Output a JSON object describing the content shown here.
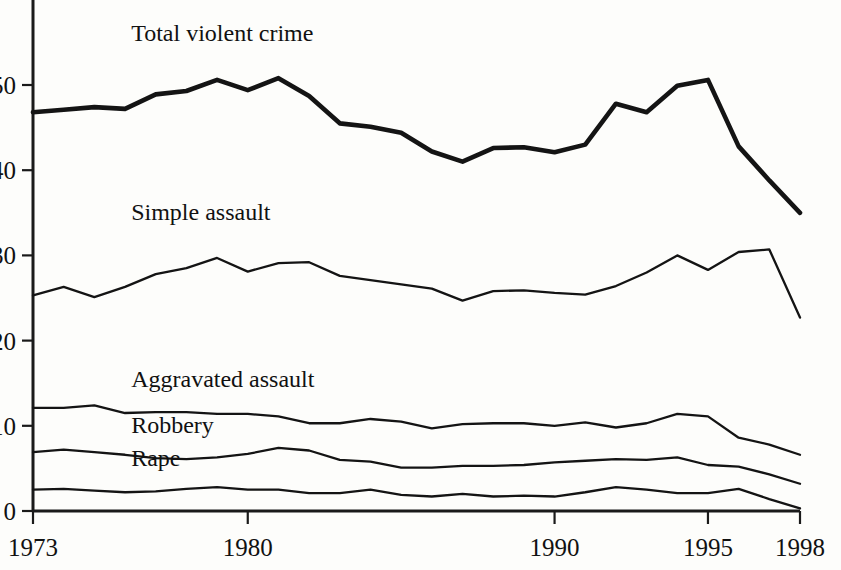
{
  "chart_data": {
    "type": "line",
    "title": "",
    "subtitle": "",
    "xlabel": "",
    "ylabel": "",
    "xlim": [
      1973,
      1998
    ],
    "ylim": [
      0,
      57
    ],
    "grid": false,
    "legend_position": "inline-labels",
    "x": [
      1973,
      1974,
      1975,
      1976,
      1977,
      1978,
      1979,
      1980,
      1981,
      1982,
      1983,
      1984,
      1985,
      1986,
      1987,
      1988,
      1989,
      1990,
      1991,
      1992,
      1993,
      1994,
      1995,
      1996,
      1997,
      1998
    ],
    "xticks": [
      1973,
      1980,
      1990,
      1995,
      1998
    ],
    "xticklabels": [
      "1973",
      "1980",
      "1990",
      "1995",
      "1998"
    ],
    "yticks": [
      0,
      10,
      20,
      30,
      40,
      50
    ],
    "yticklabels": [
      "0",
      "10",
      "20",
      "30",
      "40",
      "50"
    ],
    "series": [
      {
        "name": "Total violent crime",
        "label": "Total violent crime",
        "style": "thick",
        "label_x": 1976.2,
        "label_y": 55.2,
        "values": [
          46.8,
          47.1,
          47.4,
          47.2,
          48.9,
          49.3,
          50.6,
          49.4,
          50.8,
          48.7,
          45.5,
          45.1,
          44.4,
          42.2,
          41.0,
          42.6,
          42.7,
          42.1,
          43.0,
          47.8,
          46.8,
          49.9,
          50.6,
          42.8,
          38.8,
          35.0
        ]
      },
      {
        "name": "Simple assault",
        "label": "Simple assault",
        "style": "thin",
        "label_x": 1976.2,
        "label_y": 34.2,
        "values": [
          25.3,
          26.3,
          25.1,
          26.3,
          27.8,
          28.5,
          29.7,
          28.1,
          29.1,
          29.2,
          27.6,
          27.1,
          26.6,
          26.1,
          24.7,
          25.8,
          25.9,
          25.6,
          25.4,
          26.4,
          28.0,
          30.0,
          28.3,
          30.4,
          30.7,
          22.7
        ]
      },
      {
        "name": "Aggravated assault",
        "label": "Aggravated assault",
        "style": "thin",
        "label_x": 1976.2,
        "label_y": 14.6,
        "values": [
          12.1,
          12.1,
          12.4,
          11.5,
          11.6,
          11.6,
          11.4,
          11.4,
          11.1,
          10.3,
          10.3,
          10.8,
          10.5,
          9.7,
          10.2,
          10.3,
          10.3,
          10.0,
          10.4,
          9.8,
          10.3,
          11.4,
          11.1,
          8.6,
          7.8,
          6.6
        ]
      },
      {
        "name": "Robbery",
        "label": "Robbery",
        "style": "thin",
        "label_x": 1976.2,
        "label_y": 9.1,
        "values": [
          6.9,
          7.2,
          6.9,
          6.6,
          6.2,
          6.1,
          6.3,
          6.7,
          7.4,
          7.1,
          6.0,
          5.8,
          5.1,
          5.1,
          5.3,
          5.3,
          5.4,
          5.7,
          5.9,
          6.1,
          6.0,
          6.3,
          5.4,
          5.2,
          4.3,
          3.2
        ]
      },
      {
        "name": "Rape",
        "label": "Rape",
        "style": "thin",
        "label_x": 1976.2,
        "label_y": 5.3,
        "values": [
          2.5,
          2.6,
          2.4,
          2.2,
          2.3,
          2.6,
          2.8,
          2.5,
          2.5,
          2.1,
          2.1,
          2.5,
          1.9,
          1.7,
          2.0,
          1.7,
          1.8,
          1.7,
          2.2,
          2.8,
          2.5,
          2.1,
          2.1,
          2.6,
          1.4,
          0.3
        ]
      }
    ]
  },
  "axis": {
    "x_axis_name": "year-axis",
    "y_axis_name": "rate-axis"
  }
}
